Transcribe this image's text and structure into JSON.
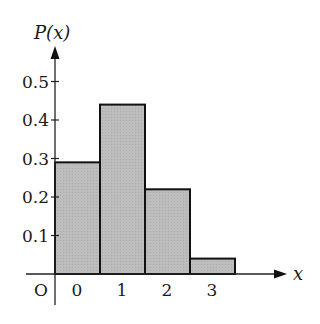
{
  "chart_data": {
    "type": "bar",
    "title": "",
    "xlabel": "x",
    "ylabel": "P(x)",
    "origin_label": "O",
    "categories": [
      "0",
      "1",
      "2",
      "3"
    ],
    "values": [
      0.29,
      0.44,
      0.22,
      0.04
    ],
    "yticks": [
      "0.1",
      "0.2",
      "0.3",
      "0.4",
      "0.5"
    ],
    "ylim": [
      0,
      0.6
    ],
    "grid": false,
    "legend": null,
    "bar_fill": "#bdbdbd",
    "bar_stroke": "#111111"
  }
}
